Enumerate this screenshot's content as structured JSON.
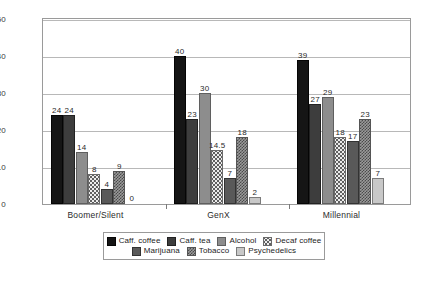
{
  "chart_data": {
    "type": "bar",
    "title": "",
    "subtitle": "",
    "xlabel": "",
    "ylabel": "",
    "ylim": [
      0,
      50
    ],
    "yticks": [
      0,
      10,
      20,
      30,
      40,
      50
    ],
    "grid": true,
    "legend_position": "bottom",
    "categories": [
      "Boomer/Silent",
      "GenX",
      "Millennial"
    ],
    "series": [
      {
        "name": "Caff. coffee",
        "values": [
          24,
          40,
          39
        ],
        "color": "#151515"
      },
      {
        "name": "Caff. tea",
        "values": [
          24,
          23,
          27
        ],
        "color": "#3d3d3d"
      },
      {
        "name": "Alcohol",
        "values": [
          14,
          30,
          29
        ],
        "color": "#8d8d8d"
      },
      {
        "name": "Decaf coffee",
        "values": [
          8,
          14.5,
          18
        ],
        "color": "#ececec"
      },
      {
        "name": "Marijuana",
        "values": [
          4,
          7,
          17
        ],
        "color": "#595959"
      },
      {
        "name": "Tobacco",
        "values": [
          9,
          18,
          23
        ],
        "color": "#9a9a9a"
      },
      {
        "name": "Psychedelics",
        "values": [
          0,
          2,
          7
        ],
        "color": "#c8c8c8"
      }
    ],
    "data_labels": [
      [
        "24",
        "24",
        "14",
        "8",
        "4",
        "9",
        "0"
      ],
      [
        "40",
        "23",
        "30",
        "14.5",
        "7",
        "18",
        "2"
      ],
      [
        "39",
        "27",
        "29",
        "18",
        "17",
        "23",
        "7"
      ]
    ]
  },
  "axis": {
    "y_tick_labels": [
      "0",
      "10",
      "20",
      "30",
      "40",
      "50"
    ],
    "x_tick_labels": [
      "Boomer/Silent",
      "GenX",
      "Millennial"
    ]
  },
  "legend": {
    "row1": [
      "Caff. coffee",
      "Caff. tea",
      "Alcohol",
      "Decaf coffee"
    ],
    "row2": [
      "Marijuana",
      "Tobacco",
      "Psychedelics"
    ]
  }
}
